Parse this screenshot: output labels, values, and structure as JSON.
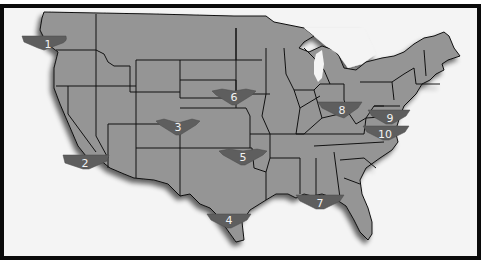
{
  "map": {
    "title": "",
    "region": "Contiguous United States",
    "colors": {
      "frame_border": "#0a0a0a",
      "background": "#f4f4f4",
      "state_fill": "#959595",
      "state_border": "#111111",
      "marker_fill": "#5e5e5e",
      "marker_text": "#f2f2f2"
    },
    "markers": [
      {
        "id": 1,
        "label": "1",
        "location": "Western Washington",
        "x": 38,
        "y": 36
      },
      {
        "id": 2,
        "label": "2",
        "location": "Southern California",
        "x": 81,
        "y": 155
      },
      {
        "id": 3,
        "label": "3",
        "location": "Colorado",
        "x": 174,
        "y": 119
      },
      {
        "id": 4,
        "label": "4",
        "location": "South Texas",
        "x": 225,
        "y": 212
      },
      {
        "id": 5,
        "label": "5",
        "location": "Oklahoma",
        "x": 239,
        "y": 149
      },
      {
        "id": 6,
        "label": "6",
        "location": "Nebraska",
        "x": 230,
        "y": 89
      },
      {
        "id": 7,
        "label": "7",
        "location": "Gulf Coast (Mississippi/Alabama)",
        "x": 316,
        "y": 195
      },
      {
        "id": 8,
        "label": "8",
        "location": "Ohio",
        "x": 338,
        "y": 102
      },
      {
        "id": 9,
        "label": "9",
        "location": "Maryland / Delaware",
        "x": 386,
        "y": 110
      },
      {
        "id": 10,
        "label": "10",
        "location": "Virginia",
        "x": 383,
        "y": 126
      }
    ]
  }
}
